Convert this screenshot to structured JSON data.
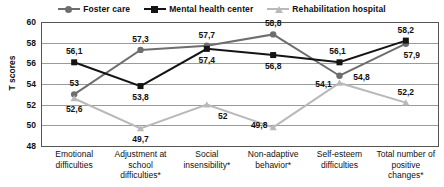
{
  "chart_data": {
    "type": "line",
    "title": "",
    "xlabel": "",
    "ylabel": "T scores",
    "ylim": [
      48,
      60
    ],
    "yticks": [
      48,
      50,
      52,
      54,
      56,
      58,
      60
    ],
    "grid": true,
    "legend_position": "top-center",
    "categories": [
      "Emotional difficulties",
      "Adjustment at school difficulties*",
      "Social insensibility*",
      "Non-adaptive behavior*",
      "Self-esteem difficulties",
      "Total number of positive changes*"
    ],
    "series": [
      {
        "name": "Foster care",
        "marker": "circle",
        "color": "#6e6e6e",
        "values": [
          53,
          57.3,
          57.7,
          58.8,
          54.8,
          57.9
        ],
        "labels": [
          "53",
          "57,3",
          "57,7",
          "58,8",
          "54,8",
          "57,9"
        ]
      },
      {
        "name": "Mental health center",
        "marker": "square",
        "color": "#141414",
        "values": [
          56.1,
          53.8,
          57.4,
          56.8,
          56.1,
          58.2
        ],
        "labels": [
          "56,1",
          "53,8",
          "57,4",
          "56,8",
          "56,1",
          "58,2"
        ]
      },
      {
        "name": "Rehabilitation hospital",
        "marker": "triangle",
        "color": "#b9b9b9",
        "values": [
          52.6,
          49.7,
          52,
          49.8,
          54.1,
          52.2
        ],
        "labels": [
          "52,6",
          "49,7",
          "52",
          "49,8",
          "54,1",
          "52,2"
        ]
      }
    ]
  },
  "axis": {
    "y_title": "T scores",
    "y_tick_labels": [
      "60",
      "58",
      "56",
      "54",
      "52",
      "50",
      "48"
    ]
  },
  "legend": {
    "items": [
      {
        "label": "Foster care",
        "marker": "circle-marker-icon",
        "color": "#6e6e6e"
      },
      {
        "label": "Mental health center",
        "marker": "square-marker-icon",
        "color": "#141414"
      },
      {
        "label": "Rehabilitation hospital",
        "marker": "triangle-marker-icon",
        "color": "#b9b9b9"
      }
    ]
  }
}
